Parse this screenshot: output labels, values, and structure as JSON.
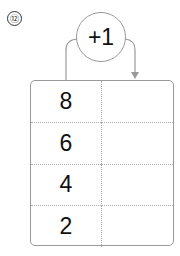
{
  "problem": {
    "number_label": "⑫"
  },
  "operation": {
    "label": "+1"
  },
  "table": {
    "rows": [
      {
        "input": "8",
        "output": ""
      },
      {
        "input": "6",
        "output": ""
      },
      {
        "input": "4",
        "output": ""
      },
      {
        "input": "2",
        "output": ""
      }
    ]
  },
  "colors": {
    "line": "#999999",
    "text": "#111111",
    "divider": "#aaaaaa"
  }
}
